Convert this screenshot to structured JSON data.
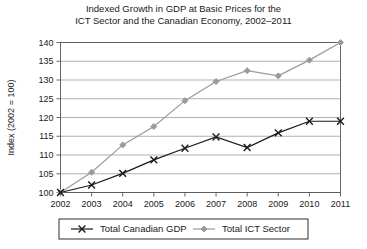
{
  "chart_data": {
    "type": "line",
    "title": "Indexed Growth in GDP at Basic Prices for the\nICT Sector and the Canadian Economy, 2002–2011",
    "xlabel": "",
    "ylabel": "Index (2002 = 100)",
    "categories": [
      "2002",
      "2003",
      "2004",
      "2005",
      "2006",
      "2007",
      "2008",
      "2009",
      "2010",
      "2011"
    ],
    "x": [
      2002,
      2003,
      2004,
      2005,
      2006,
      2007,
      2008,
      2009,
      2010,
      2011
    ],
    "ylim": [
      100,
      140
    ],
    "yticks": [
      100,
      105,
      110,
      115,
      120,
      125,
      130,
      135,
      140
    ],
    "ytick_labels": [
      "100",
      "105",
      "110",
      "115",
      "120",
      "125",
      "130",
      "135",
      "140"
    ],
    "grid": "horizontal",
    "legend_position": "bottom",
    "series": [
      {
        "name": "Total Canadian GDP",
        "values": [
          100,
          102.0,
          105.1,
          108.7,
          111.8,
          114.8,
          112.0,
          115.9,
          119.0,
          119.0
        ],
        "color": "#1a1a1a",
        "marker": "x"
      },
      {
        "name": "Total ICT Sector",
        "values": [
          100,
          105.4,
          112.7,
          117.6,
          124.5,
          129.6,
          132.5,
          131.1,
          135.3,
          140.0
        ],
        "color": "#9a9a9a",
        "marker": "diamond"
      }
    ]
  },
  "legend": {
    "items": [
      {
        "label": "Total Canadian GDP",
        "marker": "x-marker",
        "color": "#1a1a1a"
      },
      {
        "label": "Total ICT Sector",
        "marker": "diamond-marker",
        "color": "#9a9a9a"
      }
    ]
  },
  "colors": {
    "gdp_line": "#1a1a1a",
    "ict_line": "#9a9a9a",
    "grid": "#a8a8a8",
    "axis": "#555555",
    "background": "#ffffff"
  }
}
